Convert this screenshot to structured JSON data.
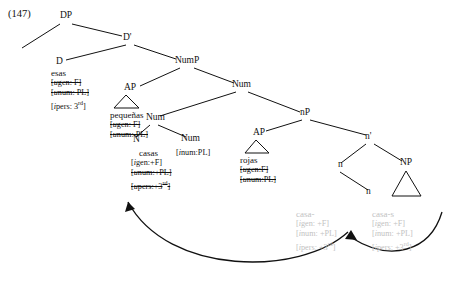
{
  "example_number": "(147)",
  "diagram": {
    "type": "syntax-tree",
    "nodes": [
      {
        "id": "DP",
        "label": "DP",
        "x": 60,
        "y": 14
      },
      {
        "id": "Dbar",
        "label": "D'",
        "x": 123,
        "y": 36
      },
      {
        "id": "D",
        "label": "D",
        "x": 56,
        "y": 60
      },
      {
        "id": "NumP",
        "label": "NumP",
        "x": 175,
        "y": 59
      },
      {
        "id": "AP1",
        "label": "AP",
        "x": 124,
        "y": 86
      },
      {
        "id": "Num1",
        "label": "Num",
        "x": 232,
        "y": 83
      },
      {
        "id": "Num2",
        "label": "Num",
        "x": 146,
        "y": 116
      },
      {
        "id": "N1",
        "label": "N",
        "x": 133,
        "y": 138
      },
      {
        "id": "Num3",
        "label": "Num",
        "x": 181,
        "y": 137
      },
      {
        "id": "AP2",
        "label": "AP",
        "x": 253,
        "y": 131
      },
      {
        "id": "nP",
        "label": "nP",
        "x": 300,
        "y": 111
      },
      {
        "id": "nbar",
        "label": "n'",
        "x": 365,
        "y": 135
      },
      {
        "id": "n1",
        "label": "n",
        "x": 338,
        "y": 163
      },
      {
        "id": "n2",
        "label": "n",
        "x": 366,
        "y": 190
      },
      {
        "id": "NP",
        "label": "NP",
        "x": 400,
        "y": 161
      }
    ],
    "terminals": {
      "esas": {
        "word": "esas",
        "features": [
          {
            "text": "[ugen: F]",
            "struck": true,
            "italic_prefix": "u"
          },
          {
            "text": "[unum: PL]",
            "struck": true,
            "italic_prefix": "u"
          },
          {
            "text": "[ipers: 3rd]",
            "struck": false,
            "italic_prefix": "i"
          }
        ]
      },
      "pequenas": {
        "word": "pequeñas",
        "features": [
          {
            "text": "[ugen: F]",
            "struck": true,
            "italic_prefix": "u"
          },
          {
            "text": "[unum: PL]",
            "struck": true,
            "italic_prefix": "u"
          }
        ]
      },
      "casas": {
        "word": "casas",
        "features": [
          {
            "text": "[igen:+F]",
            "struck": false,
            "italic_prefix": "i"
          },
          {
            "text": "[unum:+PL]",
            "struck": true,
            "italic_prefix": "u"
          },
          {
            "text": "[upers:+3rd]",
            "struck": true,
            "italic_prefix": "u"
          }
        ]
      },
      "num_feat": {
        "text": "[inum:PL]",
        "italic_prefix": "i"
      },
      "rojas": {
        "word": "rojas",
        "features": [
          {
            "text": "[ugen:F]",
            "struck": true,
            "italic_prefix": "u"
          },
          {
            "text": "[unum:PL]",
            "struck": true,
            "italic_prefix": "u"
          }
        ]
      },
      "ghost_left": {
        "word": "casa-",
        "features": [
          {
            "text": "[igen: +F]",
            "italic_prefix": "i"
          },
          {
            "text": "[inum: +PL]",
            "italic_prefix": "i"
          },
          {
            "text": "[ipers: +3rd]",
            "italic_prefix": "i"
          }
        ]
      },
      "ghost_right": {
        "word": "casa-s",
        "features": [
          {
            "text": "[igen: +F]",
            "italic_prefix": "i"
          },
          {
            "text": "[inum: +PL]",
            "italic_prefix": "i"
          },
          {
            "text": "[ipers: +3rd]",
            "italic_prefix": "i"
          }
        ]
      }
    },
    "colors": {
      "ink": "#111111",
      "ghost": "#c2c2c2"
    }
  }
}
